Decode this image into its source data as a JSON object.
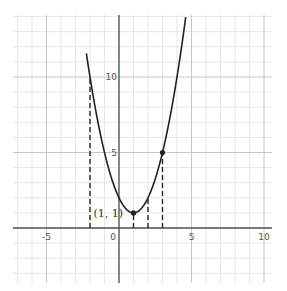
{
  "chart_data": {
    "type": "line",
    "title": "",
    "function": "f(x) = (x - 1)^2 + 1",
    "xlabel": "",
    "ylabel": "",
    "xlim": [
      -7.4,
      10.6
    ],
    "ylim": [
      -3.6,
      14.1
    ],
    "grid": true,
    "minor_grid_step": 1,
    "major_grid_step": 5,
    "x_ticks": [
      {
        "value": -5,
        "label": "-5"
      },
      {
        "value": 0,
        "label": "0"
      },
      {
        "value": 5,
        "label": "5"
      },
      {
        "value": 10,
        "label": "10"
      }
    ],
    "y_ticks": [
      {
        "value": 5,
        "label": "5"
      },
      {
        "value": 10,
        "label": "10"
      }
    ],
    "series": [
      {
        "name": "parabola",
        "x": [
          -2.2,
          -2,
          -1,
          0,
          1,
          2,
          3,
          4,
          4.6
        ],
        "values": [
          11.24,
          10,
          5,
          2,
          1,
          2,
          5,
          10,
          13.96
        ],
        "color": "#222222"
      }
    ],
    "marked_points": [
      {
        "x": 1,
        "y": 1,
        "label": "(1, 1)"
      },
      {
        "x": 3,
        "y": 5,
        "label": ""
      }
    ],
    "dashed_verticals": [
      {
        "x": -2,
        "y_top": 10
      },
      {
        "x": 1,
        "y_top": 1
      },
      {
        "x": 2,
        "y_top": 2
      },
      {
        "x": 3,
        "y_top": 5
      }
    ],
    "annotations": [
      "(1, 1)"
    ]
  },
  "colors": {
    "curve": "#222222",
    "axis": "#555555",
    "major_grid": "#c8c8c8",
    "minor_grid": "#e6e6e6"
  }
}
